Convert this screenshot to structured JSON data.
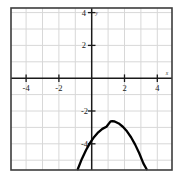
{
  "figure": {
    "name": "cartesian-parabola-plot",
    "background_color": "#ffffff",
    "border_color": "#3c3c3c",
    "grid_color": "#d8d8d8",
    "axis_color": "#1a1a1a",
    "curve_color": "#000000"
  },
  "axes": {
    "x_axis_label": "x",
    "y_axis_label": "y",
    "x_tick_labels": [
      "-4",
      "-2",
      "2",
      "4"
    ],
    "x_tick_values": [
      -4,
      -2,
      2,
      4
    ],
    "y_tick_labels": [
      "4",
      "2",
      "-2",
      "-4"
    ],
    "y_tick_values": [
      4,
      2,
      -2,
      -4
    ],
    "xlim": [
      -4.9,
      5.0
    ],
    "ylim": [
      -5.55,
      4.35
    ],
    "grid": true,
    "grid_step": 1
  },
  "chart_data": {
    "type": "line",
    "title": "",
    "xlabel": "x",
    "ylabel": "y",
    "grid": true,
    "legend": false,
    "xlim": [
      -4.9,
      5.0
    ],
    "ylim": [
      -5.55,
      4.35
    ],
    "xticks": [
      -4,
      -2,
      2,
      4
    ],
    "yticks": [
      4,
      2,
      -2,
      -4
    ],
    "series": [
      {
        "name": "parabola",
        "shape": "downward-parabola",
        "vertex": [
          1.25,
          -2.62
        ],
        "color": "#000000",
        "x": [
          -0.85,
          -0.6,
          -0.35,
          -0.1,
          0.15,
          0.4,
          0.65,
          0.9,
          1.15,
          1.25,
          1.4,
          1.65,
          1.9,
          2.15,
          2.4,
          2.65,
          2.9,
          3.15,
          3.35
        ],
        "y": [
          -5.55,
          -4.92,
          -4.39,
          -3.94,
          -3.58,
          -3.3,
          -3.09,
          -2.96,
          -2.63,
          -2.62,
          -2.64,
          -2.76,
          -2.96,
          -3.24,
          -3.6,
          -4.05,
          -4.58,
          -5.19,
          -5.55
        ]
      }
    ]
  }
}
